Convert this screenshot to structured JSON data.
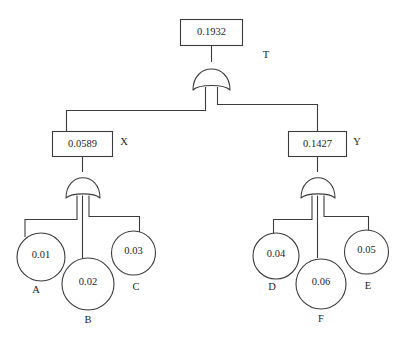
{
  "diagram": {
    "type": "fault-tree",
    "title": "",
    "gate_type": "OR",
    "nodes": {
      "top": {
        "id": "T",
        "value": "0.1932",
        "label": "T",
        "shape": "rectangle"
      },
      "x": {
        "id": "X",
        "value": "0.0589",
        "label": "X",
        "shape": "rectangle"
      },
      "y": {
        "id": "Y",
        "value": "0.1427",
        "label": "Y",
        "shape": "rectangle"
      },
      "a": {
        "id": "A",
        "value": "0.01",
        "label": "A",
        "shape": "circle"
      },
      "b": {
        "id": "B",
        "value": "0.02",
        "label": "B",
        "shape": "circle"
      },
      "c": {
        "id": "C",
        "value": "0.03",
        "label": "C",
        "shape": "circle"
      },
      "d": {
        "id": "D",
        "value": "0.04",
        "label": "D",
        "shape": "circle"
      },
      "f": {
        "id": "F",
        "value": "0.06",
        "label": "F",
        "shape": "circle"
      },
      "e": {
        "id": "E",
        "value": "0.05",
        "label": "E",
        "shape": "circle"
      }
    },
    "gates": [
      {
        "name": "top-gate",
        "type": "OR",
        "output": "T",
        "inputs": [
          "X",
          "Y"
        ]
      },
      {
        "name": "left-gate",
        "type": "OR",
        "output": "X",
        "inputs": [
          "A",
          "B",
          "C"
        ]
      },
      {
        "name": "right-gate",
        "type": "OR",
        "output": "Y",
        "inputs": [
          "D",
          "F",
          "E"
        ]
      }
    ],
    "colors": {
      "stroke": "#3c3c3c",
      "fill": "#ffffff",
      "text": "#1d1d1d"
    }
  }
}
